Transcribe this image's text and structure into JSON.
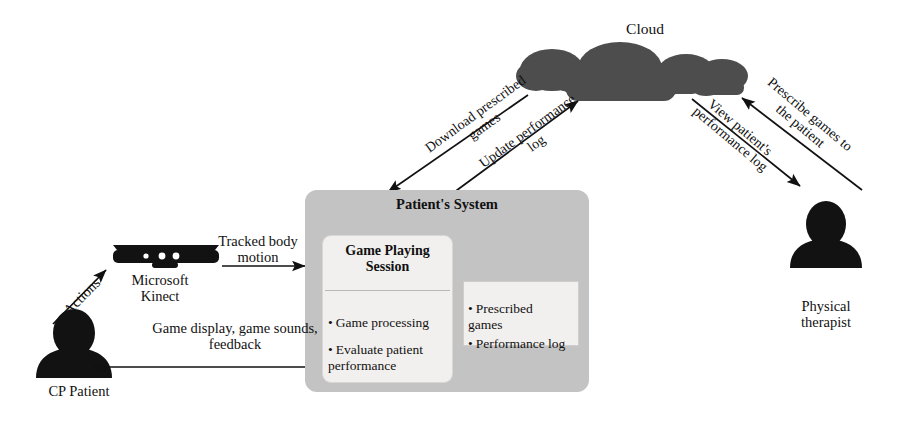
{
  "diagram": {
    "cloud": {
      "label": "Cloud"
    },
    "flows": {
      "download_prescribed_games": "Download prescribed\ngames",
      "update_performance_log": "Update performance\nlog",
      "view_patient_performance_log": "View patient's\nperformance log",
      "prescribe_games_to_patient": "Prescribe games to\nthe patient",
      "tracked_body_motion": "Tracked body\nmotion",
      "game_display_sounds_feedback": "Game display, game sounds,\nfeedback",
      "actions": "Actions"
    },
    "patient_system": {
      "title": "Patient's System",
      "game_playing_session": {
        "title": "Game Playing\nSession",
        "items": [
          "Game processing",
          "Evaluate patient\nperformance"
        ]
      },
      "storage": {
        "items": [
          "Prescribed\ngames",
          "Performance log"
        ]
      }
    },
    "actors": {
      "kinect": "Microsoft\nKinect",
      "cp_patient": "CP Patient",
      "physical_therapist": "Physical\ntherapist"
    },
    "colors": {
      "cloud_gray": "#4d4d4d",
      "panel_gray": "#c3c3c3",
      "inner_box": "#f1f0ee",
      "figure_black": "#121212",
      "line": "#111111"
    }
  }
}
